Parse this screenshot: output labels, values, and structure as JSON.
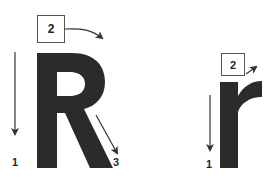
{
  "diagram": {
    "uppercase": {
      "letter": "R",
      "steps": [
        {
          "number": "1",
          "direction": "down"
        },
        {
          "number": "2",
          "direction": "curve-right"
        },
        {
          "number": "3",
          "direction": "diagonal-down-right"
        }
      ]
    },
    "lowercase": {
      "letter": "r",
      "steps": [
        {
          "number": "1",
          "direction": "down"
        },
        {
          "number": "2",
          "direction": "up-right"
        }
      ]
    },
    "colors": {
      "letter": "#2b2b2b",
      "arrow": "#444444",
      "background": "#ffffff"
    }
  }
}
